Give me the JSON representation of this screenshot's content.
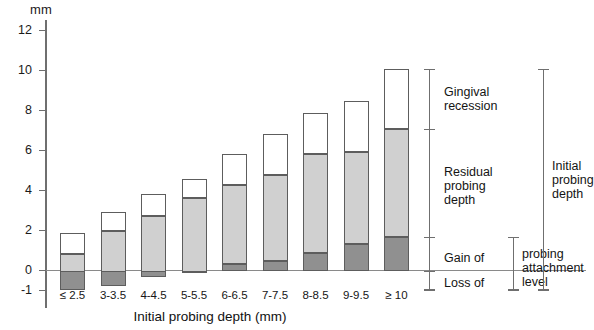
{
  "chart_data": {
    "type": "bar",
    "subtype": "stacked-bar-with-negative-base",
    "title": "",
    "xlabel": "Initial probing depth (mm)",
    "ylabel": "mm",
    "ylim": [
      -1,
      12
    ],
    "yticks": [
      -1,
      0,
      2,
      4,
      6,
      8,
      10,
      12
    ],
    "ytick_labels": [
      "-1",
      "0",
      "2",
      "4",
      "6",
      "8",
      "10",
      "12"
    ],
    "grid": false,
    "legend_position": "right-annotations",
    "categories": [
      "≤ 2.5",
      "3-3.5",
      "4-4.5",
      "5-5.5",
      "6-6.5",
      "7-7.5",
      "8-8.5",
      "9-9.5",
      "≥ 10"
    ],
    "series": [
      {
        "name": "Gain of / Loss of probing attachment level",
        "fill": "dark",
        "color": "#909090",
        "bottoms": [
          -0.95,
          -0.75,
          -0.3,
          -0.05,
          0.35,
          0.5,
          0.9,
          1.35,
          1.7
        ],
        "tops": [
          0.85,
          2.0,
          2.75,
          3.65,
          4.3,
          4.8,
          5.85,
          5.95,
          7.1
        ]
      },
      {
        "name": "Residual probing depth",
        "fill": "light",
        "color": "#d0d0d0",
        "bottoms": [
          0.85,
          2.0,
          2.75,
          3.65,
          4.3,
          4.8,
          5.85,
          5.95,
          7.1
        ],
        "tops": [
          1.9,
          2.95,
          3.85,
          4.6,
          5.85,
          6.85,
          7.9,
          8.5,
          10.1
        ]
      },
      {
        "name": "Gingival recession",
        "fill": "white",
        "color": "#ffffff",
        "bottoms": [
          0.85,
          2.0,
          2.75,
          3.65,
          4.3,
          4.8,
          5.85,
          5.95,
          7.1
        ],
        "tops": [
          1.9,
          2.95,
          3.85,
          4.6,
          5.85,
          6.85,
          7.9,
          8.5,
          10.1
        ]
      }
    ],
    "annotations": [
      {
        "name": "gingival-recession",
        "label": "Gingival\nrecession",
        "from": 7.1,
        "to": 10.1
      },
      {
        "name": "residual-probing-depth",
        "label": "Residual\nprobing\ndepth",
        "from": 1.7,
        "to": 7.1
      },
      {
        "name": "gain-of",
        "label": "Gain of",
        "from": 0.0,
        "to": 1.7
      },
      {
        "name": "loss-of",
        "label": "Loss of",
        "from": -1.0,
        "to": 0.0
      },
      {
        "name": "probing-attachment-level",
        "label": "probing\nattachment\nlevel",
        "from": -1.0,
        "to": 1.7
      },
      {
        "name": "initial-probing-depth",
        "label": "Initial\nprobing\ndepth",
        "from": -1.0,
        "to": 10.1
      }
    ]
  }
}
